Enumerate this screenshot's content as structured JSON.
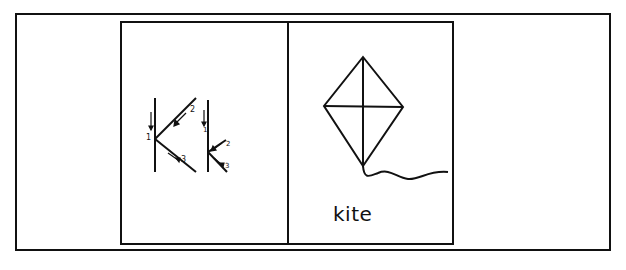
{
  "worksheet": {
    "letter": "K",
    "letter_strokes": {
      "uppercase_numbers": [
        "1",
        "2",
        "3"
      ],
      "lowercase_numbers": [
        "1",
        "2",
        "3"
      ]
    },
    "picture": "kite-illustration",
    "word": "kite"
  },
  "colors": {
    "ink": "#111111",
    "paper": "#ffffff"
  }
}
